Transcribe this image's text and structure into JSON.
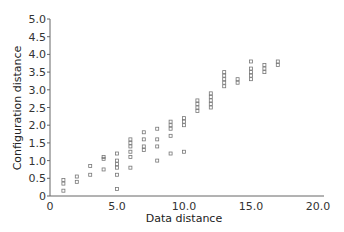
{
  "chart_data": {
    "type": "scatter",
    "title": "",
    "xlabel": "Data distance",
    "ylabel": "Configuration distance",
    "xlim": [
      0,
      20
    ],
    "ylim": [
      0,
      5
    ],
    "xticks": [
      0,
      5,
      10,
      15,
      20
    ],
    "xtick_labels": [
      "0",
      "5.0",
      "10.0",
      "15.0",
      "20.0"
    ],
    "yticks": [
      0,
      0.5,
      1,
      1.5,
      2,
      2.5,
      3,
      3.5,
      4,
      4.5,
      5
    ],
    "ytick_labels": [
      "0",
      "0.5",
      "1.0",
      "1.5",
      "2.0",
      "2.5",
      "3.0",
      "3.5",
      "4.0",
      "4.5",
      "5.0"
    ],
    "grid": false,
    "legend": null,
    "marker": "open-square",
    "series": [
      {
        "name": "distances",
        "points": [
          [
            1,
            0.45
          ],
          [
            1,
            0.35
          ],
          [
            1,
            0.15
          ],
          [
            2,
            0.55
          ],
          [
            2,
            0.4
          ],
          [
            3,
            0.85
          ],
          [
            3,
            0.6
          ],
          [
            4,
            1.1
          ],
          [
            4,
            1.05
          ],
          [
            4,
            0.75
          ],
          [
            5,
            1.2
          ],
          [
            5,
            1.0
          ],
          [
            5,
            0.9
          ],
          [
            5,
            0.8
          ],
          [
            5,
            0.6
          ],
          [
            5,
            0.2
          ],
          [
            6,
            1.6
          ],
          [
            6,
            1.5
          ],
          [
            6,
            1.4
          ],
          [
            6,
            1.25
          ],
          [
            6,
            1.1
          ],
          [
            6,
            0.8
          ],
          [
            7,
            1.8
          ],
          [
            7,
            1.6
          ],
          [
            7,
            1.4
          ],
          [
            7,
            1.3
          ],
          [
            8,
            1.9
          ],
          [
            8,
            1.6
          ],
          [
            8,
            1.4
          ],
          [
            8,
            1.0
          ],
          [
            9,
            2.1
          ],
          [
            9,
            2.0
          ],
          [
            9,
            1.9
          ],
          [
            9,
            1.7
          ],
          [
            9,
            1.2
          ],
          [
            10,
            2.2
          ],
          [
            10,
            2.1
          ],
          [
            10,
            2.0
          ],
          [
            10,
            1.25
          ],
          [
            11,
            2.7
          ],
          [
            11,
            2.6
          ],
          [
            11,
            2.5
          ],
          [
            11,
            2.4
          ],
          [
            12,
            2.9
          ],
          [
            12,
            2.8
          ],
          [
            12,
            2.7
          ],
          [
            12,
            2.6
          ],
          [
            12,
            2.5
          ],
          [
            13,
            3.5
          ],
          [
            13,
            3.4
          ],
          [
            13,
            3.3
          ],
          [
            13,
            3.2
          ],
          [
            13,
            3.1
          ],
          [
            14,
            3.3
          ],
          [
            14,
            3.2
          ],
          [
            15,
            3.8
          ],
          [
            15,
            3.6
          ],
          [
            15,
            3.5
          ],
          [
            15,
            3.4
          ],
          [
            15,
            3.3
          ],
          [
            16,
            3.7
          ],
          [
            16,
            3.6
          ],
          [
            16,
            3.5
          ],
          [
            17,
            3.8
          ],
          [
            17,
            3.7
          ]
        ]
      }
    ]
  },
  "colors": {
    "axis": "#666666",
    "marker": "#777777",
    "text": "#333333"
  }
}
